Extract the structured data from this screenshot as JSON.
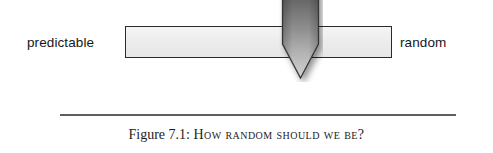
{
  "figure": {
    "scale": {
      "left_label": "predictable",
      "right_label": "random",
      "pointer_name": "slider-pointer",
      "pointer_position_fraction": 0.585,
      "bar_fill_color": "#eeeeee",
      "bar_border_color": "#2a2a2a",
      "pointer_dark_color": "#4f4f4f",
      "pointer_light_color": "#c9c9c9"
    },
    "caption": {
      "lead": "Figure 7.1: ",
      "title": "How random should we be?",
      "rule_color": "#5b5f63"
    }
  }
}
